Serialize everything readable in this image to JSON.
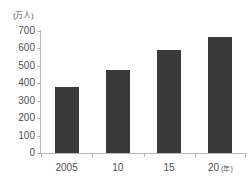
{
  "chart_data": {
    "type": "bar",
    "title": "",
    "subtitle": "",
    "xlabel": "(年)",
    "ylabel": "(万人)",
    "unit_label": "(万人)",
    "categories": [
      "2005",
      "10",
      "15",
      "20"
    ],
    "category_suffixes": [
      "",
      "",
      "",
      "(年)"
    ],
    "values": [
      380,
      475,
      590,
      665
    ],
    "series": [
      {
        "name": "",
        "values": [
          380,
          475,
          590,
          665
        ]
      }
    ],
    "ylim": [
      0,
      700
    ],
    "y_ticks": [
      "700",
      "600",
      "500",
      "400",
      "300",
      "200",
      "100",
      "0"
    ],
    "y_tick_values": [
      700,
      600,
      500,
      400,
      300,
      200,
      100,
      0
    ],
    "grid": false,
    "legend": "none",
    "bar_color": "#3a3a3a",
    "axis_color": "#b9b9b9",
    "background_color": "#fefefe",
    "text_color": "#4f4f4f"
  }
}
